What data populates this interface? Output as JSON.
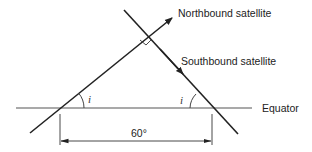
{
  "diagram": {
    "labels": {
      "northbound": "Northbound satellite",
      "southbound": "Southbound satellite",
      "equator": "Equator",
      "separation": "60°",
      "angle_left": "i",
      "angle_right": "i"
    },
    "colors": {
      "line": "#222222",
      "equator": "#555555",
      "text": "#222222"
    }
  }
}
